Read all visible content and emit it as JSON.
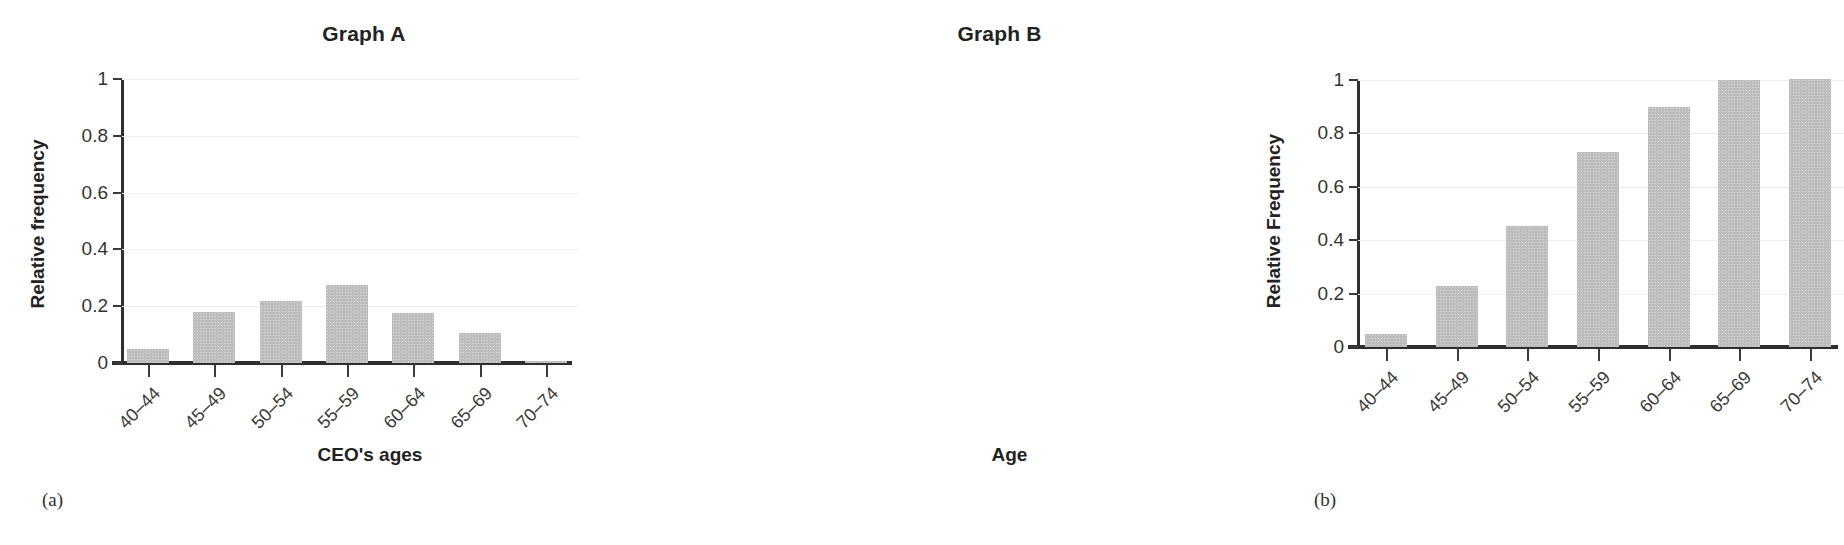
{
  "figure": {
    "panels": [
      {
        "caption": "(a)",
        "title": "Graph A",
        "xlabel": "CEO's ages",
        "ylabel": "Relative frequency"
      },
      {
        "caption": "(b)",
        "title": "Graph B",
        "xlabel": "Age",
        "ylabel": "Relative Frequency"
      }
    ]
  },
  "chart_data": [
    {
      "type": "bar",
      "title": "Graph A",
      "xlabel": "CEO's ages",
      "ylabel": "Relative frequency",
      "categories": [
        "40–44",
        "45–49",
        "50–54",
        "55–59",
        "60–64",
        "65–69",
        "70–74"
      ],
      "values": [
        0.05,
        0.18,
        0.22,
        0.275,
        0.175,
        0.105,
        0.005
      ],
      "ylim": [
        0,
        1
      ],
      "yticks": [
        0,
        0.2,
        0.4,
        0.6,
        0.8,
        1
      ],
      "ytick_labels": [
        "0",
        "0.2",
        "0.4",
        "0.6",
        "0.8",
        "1"
      ],
      "grid": true,
      "legend": "none",
      "bar_color": "#bdbdbd"
    },
    {
      "type": "bar",
      "title": "Graph B",
      "xlabel": "Age",
      "ylabel": "Relative Frequency",
      "categories": [
        "40–44",
        "45–49",
        "50–54",
        "55–59",
        "60–64",
        "65–69",
        "70–74"
      ],
      "values": [
        0.05,
        0.23,
        0.455,
        0.73,
        0.9,
        1.0,
        1.005
      ],
      "ylim": [
        0,
        1
      ],
      "yticks": [
        0,
        0.2,
        0.4,
        0.6,
        0.8,
        1
      ],
      "ytick_labels": [
        "0",
        "0.2",
        "0.4",
        "0.6",
        "0.8",
        "1"
      ],
      "grid": true,
      "legend": "none",
      "bar_color": "#bdbdbd"
    }
  ]
}
